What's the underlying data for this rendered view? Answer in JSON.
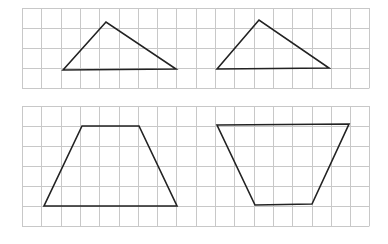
{
  "colors": {
    "background": "#ffffff",
    "grid": "#c8c8c8",
    "shape_stroke": "#222222"
  },
  "grids": [
    {
      "name": "top-grid",
      "x": 22,
      "y": 8,
      "cols": 18,
      "rows": 4,
      "cell_w": 19.3,
      "cell_h": 20
    },
    {
      "name": "bottom-grid",
      "x": 22,
      "y": 106,
      "cols": 18,
      "rows": 6,
      "cell_w": 19.3,
      "cell_h": 20
    }
  ],
  "shapes": [
    {
      "name": "triangle-left",
      "type": "triangle",
      "points": [
        [
          63,
          70
        ],
        [
          106,
          22
        ],
        [
          176,
          69
        ]
      ]
    },
    {
      "name": "triangle-right",
      "type": "triangle",
      "points": [
        [
          217,
          69
        ],
        [
          259,
          20
        ],
        [
          329,
          68
        ]
      ]
    },
    {
      "name": "trapezoid-left",
      "type": "trapezoid",
      "points": [
        [
          82,
          126
        ],
        [
          139,
          126
        ],
        [
          177,
          206
        ],
        [
          44,
          206
        ]
      ]
    },
    {
      "name": "trapezoid-right",
      "type": "trapezoid",
      "points": [
        [
          217,
          125
        ],
        [
          349,
          124
        ],
        [
          312,
          204
        ],
        [
          255,
          205
        ]
      ]
    }
  ]
}
